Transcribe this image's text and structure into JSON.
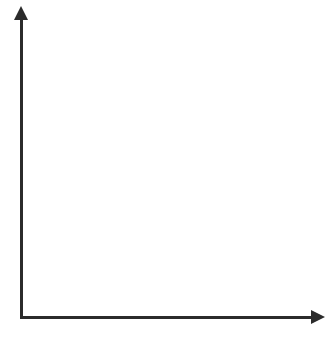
{
  "figure": {
    "kind": "blank-coordinate-grid",
    "background_color": "#ffffff",
    "axis_color": "#2b2b2b",
    "grid_color": "#9a9a9f",
    "label_color": "#2f2f2f",
    "marker_color": "#111111"
  },
  "axes": {
    "x": {
      "arrow": true,
      "tick_labels": [
        "0",
        "1",
        "2",
        "3",
        "4",
        "5",
        "6"
      ],
      "tick_values": [
        0,
        1,
        2,
        3,
        4,
        5,
        6
      ],
      "range": [
        0,
        6.5
      ]
    },
    "y": {
      "arrow": true,
      "tick_labels": [
        "1",
        "2",
        "3",
        "4",
        "5",
        "6"
      ],
      "tick_values": [
        1,
        2,
        3,
        4,
        5,
        6
      ],
      "origin_label": "0",
      "range": [
        0,
        6.5
      ]
    }
  },
  "grid": {
    "minor_step": 0.5,
    "major_step": 1,
    "style": "dotted",
    "x_lines": [
      0.5,
      1,
      1.5,
      2,
      2.5,
      3,
      3.5,
      4,
      4.5,
      5,
      5.5,
      6,
      6.5
    ],
    "y_lines": [
      0.5,
      1,
      1.5,
      2,
      2.5,
      3,
      3.5,
      4,
      4.5,
      5,
      5.5,
      6,
      6.5
    ]
  },
  "marker": {
    "shape": "circle",
    "color": "#111111",
    "clipped_at_right_edge": true
  },
  "chart_data": {
    "type": "scatter",
    "title": "",
    "xlabel": "",
    "ylabel": "",
    "xlim": [
      0,
      6.5
    ],
    "ylim": [
      0,
      6.5
    ],
    "xticks": [
      0,
      1,
      2,
      3,
      4,
      5,
      6
    ],
    "yticks": [
      0,
      1,
      2,
      3,
      4,
      5,
      6
    ],
    "grid": true,
    "legend": null,
    "series": [
      {
        "name": "plotted points",
        "x": [],
        "y": []
      }
    ],
    "annotations": []
  }
}
